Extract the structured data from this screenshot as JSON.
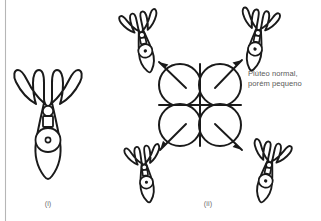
{
  "figure": {
    "background_color": "#ffffff",
    "ink_color": "#1a1a1a",
    "rule_color": "#b6b6b6",
    "caption_color": "#6d6d6d",
    "annotation_color": "#595959"
  },
  "panels": [
    {
      "id": "panel-i",
      "caption": "(i)",
      "caption_x": 48,
      "caption_y": 206,
      "description": "normal-size pluteus larva"
    },
    {
      "id": "panel-ii",
      "caption": "(ii)",
      "caption_x": 208,
      "caption_y": 206,
      "description": "four-cell embryo separating into four small plutei"
    }
  ],
  "annotations": [
    {
      "name": "pluteus-label",
      "lines": [
        "Plúteo normal,",
        "porém pequeno"
      ],
      "x": 248,
      "y": 74,
      "line_height": 10
    }
  ],
  "embryo": {
    "name": "four-cell-embryo",
    "cell_count": 4,
    "center_x": 200,
    "center_y": 105,
    "cell_radius": 21
  },
  "larvae": [
    {
      "name": "larva-large-normal",
      "size": "large",
      "cx": 48,
      "cy": 120,
      "rotation": 0,
      "scale": 1.0
    },
    {
      "name": "larva-small-top-left",
      "size": "small",
      "cx": 143,
      "cy": 40,
      "rotation": -12,
      "scale": 0.56
    },
    {
      "name": "larva-small-top-right",
      "size": "small",
      "cx": 257,
      "cy": 38,
      "rotation": 10,
      "scale": 0.56
    },
    {
      "name": "larva-small-bottom-left",
      "size": "small",
      "cx": 145,
      "cy": 172,
      "rotation": -8,
      "scale": 0.52
    },
    {
      "name": "larva-small-bottom-right",
      "size": "small",
      "cx": 268,
      "cy": 170,
      "rotation": 12,
      "scale": 0.56
    }
  ],
  "arrows": [
    {
      "name": "arrow-to-top-left",
      "x1": 186,
      "y1": 88,
      "x2": 158,
      "y2": 62
    },
    {
      "name": "arrow-to-top-right",
      "x1": 215,
      "y1": 88,
      "x2": 243,
      "y2": 60
    },
    {
      "name": "arrow-to-bottom-left",
      "x1": 186,
      "y1": 124,
      "x2": 160,
      "y2": 150
    },
    {
      "name": "arrow-to-bottom-right",
      "x1": 215,
      "y1": 124,
      "x2": 243,
      "y2": 150
    }
  ]
}
